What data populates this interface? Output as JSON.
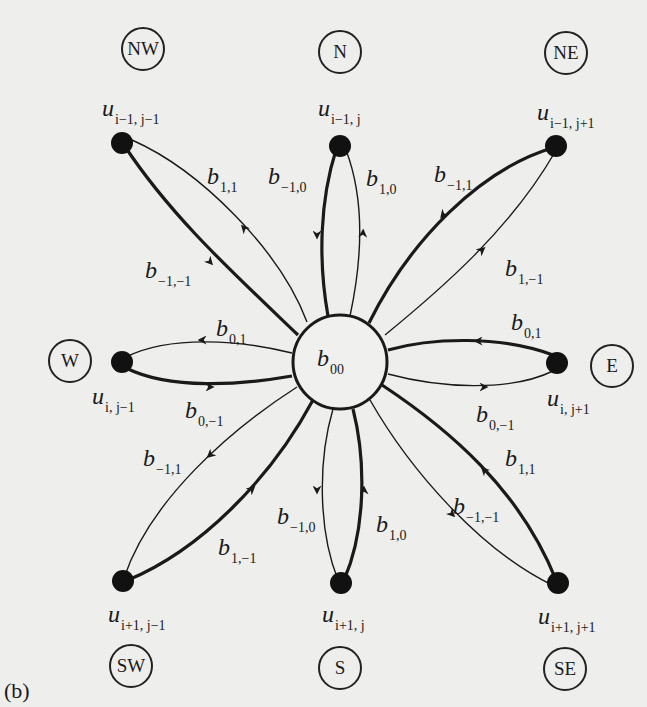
{
  "figure": {
    "panel_label": "(b)",
    "center": {
      "label_main": "b",
      "label_sub": "00"
    },
    "compass": {
      "NW": "NW",
      "N": "N",
      "NE": "NE",
      "W": "W",
      "E": "E",
      "SW": "SW",
      "S": "S",
      "SE": "SE"
    },
    "nodes": {
      "NW": {
        "main": "u",
        "sub": "i−1, j−1"
      },
      "N": {
        "main": "u",
        "sub": "i−1, j"
      },
      "NE": {
        "main": "u",
        "sub": "i−1, j+1"
      },
      "W": {
        "main": "u",
        "sub": "i, j−1"
      },
      "E": {
        "main": "u",
        "sub": "i, j+1"
      },
      "SW": {
        "main": "u",
        "sub": "i+1, j−1"
      },
      "S": {
        "main": "u",
        "sub": "i+1, j"
      },
      "SE": {
        "main": "u",
        "sub": "i+1, j+1"
      }
    },
    "edges": {
      "NW_out": {
        "main": "b",
        "sub": "1,1"
      },
      "NW_in": {
        "main": "b",
        "sub": "−1,−1"
      },
      "N_in": {
        "main": "b",
        "sub": "−1,0"
      },
      "N_out": {
        "main": "b",
        "sub": "1,0"
      },
      "NE_in": {
        "main": "b",
        "sub": "−1,1"
      },
      "NE_out": {
        "main": "b",
        "sub": "1,−1"
      },
      "W_out": {
        "main": "b",
        "sub": "0,1"
      },
      "W_in": {
        "main": "b",
        "sub": "0,−1"
      },
      "E_in": {
        "main": "b",
        "sub": "0,1"
      },
      "E_out": {
        "main": "b",
        "sub": "0,−1"
      },
      "SW_out": {
        "main": "b",
        "sub": "−1,1"
      },
      "SW_in": {
        "main": "b",
        "sub": "1,−1"
      },
      "S_out": {
        "main": "b",
        "sub": "−1,0"
      },
      "S_in": {
        "main": "b",
        "sub": "1,0"
      },
      "SE_in": {
        "main": "b",
        "sub": "1,1"
      },
      "SE_out": {
        "main": "b",
        "sub": "−1,−1"
      }
    },
    "colors": {
      "background": "#eeeeec",
      "ink": "#1a1a1a"
    }
  }
}
